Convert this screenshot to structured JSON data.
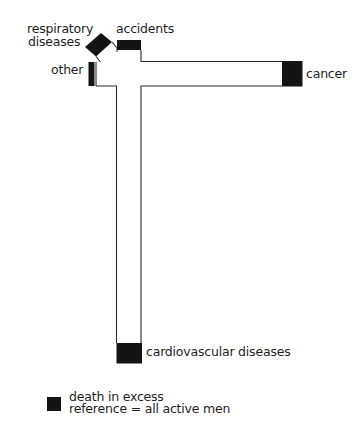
{
  "diagram": {
    "type": "mortality-profile-cross",
    "colors": {
      "excess_fill": "#141414",
      "outline": "#2a2a2a",
      "background": "#ffffff"
    },
    "arms": [
      {
        "id": "respiratory",
        "label_line1": "respiratory",
        "label_line2": "diseases",
        "direction": "up-left (diagonal)",
        "excess": true
      },
      {
        "id": "accidents",
        "label": "accidents",
        "direction": "up",
        "excess": true
      },
      {
        "id": "other",
        "label": "other",
        "direction": "left",
        "excess": true
      },
      {
        "id": "cancer",
        "label": "cancer",
        "direction": "right",
        "excess": true
      },
      {
        "id": "cardiovascular",
        "label": "cardiovascular diseases",
        "direction": "down",
        "excess": true
      }
    ],
    "legend": {
      "swatch_meaning": "death in excess",
      "reference": "reference = all active men"
    }
  }
}
